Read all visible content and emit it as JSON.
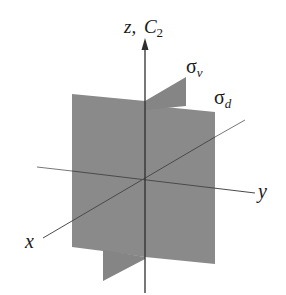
{
  "diagram": {
    "axes": {
      "z": {
        "label": "z,",
        "secondary": "C",
        "subscript": "2"
      },
      "y": {
        "label": "y"
      },
      "x": {
        "label": "x"
      }
    },
    "planes": [
      {
        "name": "sigma-v",
        "symbol": "σ",
        "subscript": "v"
      },
      {
        "name": "sigma-d",
        "symbol": "σ",
        "subscript": "d"
      }
    ],
    "colors": {
      "plane": "#8a8a8a",
      "axis": "#3a3a3a",
      "thin_line": "#777777",
      "text": "#1a1a1a"
    }
  }
}
